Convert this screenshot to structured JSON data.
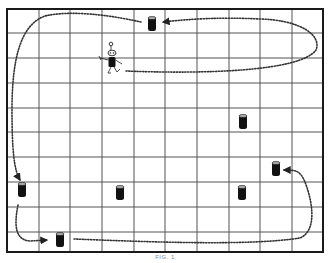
{
  "figure": {
    "caption": "FIG. 1",
    "colors": {
      "grid": "#555555",
      "frame": "#1a1a1a",
      "path": "#333333",
      "can": "#111111",
      "background": "#ffffff"
    }
  },
  "grid": {
    "left": 7,
    "top": 9,
    "right": 323,
    "bottom": 252,
    "columns": 10,
    "col_lines": [
      39,
      70,
      102,
      134,
      165,
      197,
      229,
      260,
      292
    ],
    "row_lines": [
      33,
      58,
      83,
      108,
      132,
      157,
      182,
      207,
      232
    ]
  },
  "robot": {
    "x": 112,
    "y": 63,
    "label": "robot"
  },
  "cans": [
    {
      "id": "can-1",
      "x": 152,
      "y": 24
    },
    {
      "id": "can-2",
      "x": 243,
      "y": 122
    },
    {
      "id": "can-3",
      "x": 276,
      "y": 169
    },
    {
      "id": "can-4",
      "x": 22,
      "y": 190
    },
    {
      "id": "can-5",
      "x": 120,
      "y": 193
    },
    {
      "id": "can-6",
      "x": 242,
      "y": 193
    },
    {
      "id": "can-7",
      "x": 60,
      "y": 240
    }
  ],
  "paths": [
    {
      "id": "path-robot-loop",
      "d": "M 126 71 C 200 74, 300 72, 316 50 C 322 35, 300 20, 260 19 C 220 17, 190 19, 163 22"
    },
    {
      "id": "path-can1-to-can4",
      "d": "M 141 22 C 110 15, 70 10, 45 16 C 20 25, 12 60, 12 110 C 12 150, 14 170, 20 180"
    },
    {
      "id": "path-can4-to-can7",
      "d": "M 18 205 C 14 225, 15 240, 30 241 L 47 240"
    },
    {
      "id": "path-can7-to-can3",
      "d": "M 74 239 C 150 242, 250 246, 300 238 C 318 230, 312 200, 305 182 C 300 170, 295 170, 284 170"
    }
  ]
}
